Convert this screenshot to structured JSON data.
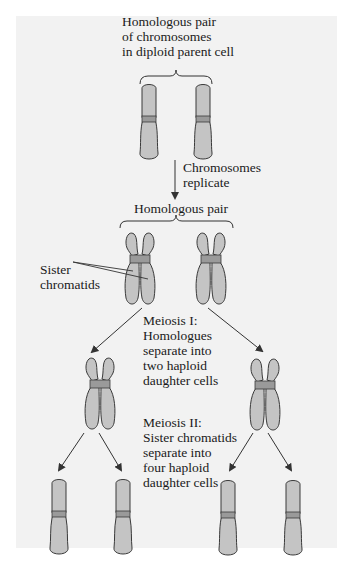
{
  "diagram": {
    "type": "meiosis-flow",
    "colors": {
      "background": "#f2f2f2",
      "chromosome_fill": "#c4c4c4",
      "centromere_fill": "#9a9a9a",
      "outline": "#3a3a3a",
      "arrow": "#333333",
      "text": "#1a1a1a"
    },
    "labels": {
      "parent_title_line1": "Homologous pair",
      "parent_title_line2": "of chromosomes",
      "parent_title_line3": "in diploid parent cell",
      "replicate_line1": "Chromosomes",
      "replicate_line2": "replicate",
      "homologous_pair": "Homologous pair",
      "sister_line1": "Sister",
      "sister_line2": "chromatids",
      "meiosis1_line1": "Meiosis I:",
      "meiosis1_line2": "Homologues",
      "meiosis1_line3": "separate into",
      "meiosis1_line4": "two haploid",
      "meiosis1_line5": "daughter cells",
      "meiosis2_line1": "Meiosis II:",
      "meiosis2_line2": "Sister chromatids",
      "meiosis2_line3": "separate into",
      "meiosis2_line4": "four haploid",
      "meiosis2_line5": "daughter cells"
    },
    "stages": [
      {
        "name": "diploid parent cell",
        "chromosomes": 2,
        "form": "single chromatid"
      },
      {
        "name": "after replication",
        "chromosomes": 2,
        "form": "sister chromatids"
      },
      {
        "name": "after meiosis I",
        "chromosomes": 2,
        "form": "sister chromatids"
      },
      {
        "name": "after meiosis II",
        "chromosomes": 4,
        "form": "single chromatid"
      }
    ]
  }
}
